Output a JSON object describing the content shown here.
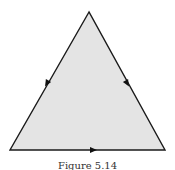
{
  "figure": {
    "shape": "equilateral-triangle",
    "fill_color": "#e4e4e4",
    "stroke_color": "#1a1a1a",
    "vertices": [
      [
        89,
        12
      ],
      [
        10,
        150
      ],
      [
        165,
        150
      ]
    ],
    "edge_arrows": [
      {
        "edge": "left",
        "direction": "down-left",
        "x": 47,
        "y": 83
      },
      {
        "edge": "right",
        "direction": "down-right",
        "x": 127,
        "y": 83
      },
      {
        "edge": "bottom",
        "direction": "right",
        "x": 93,
        "y": 150
      }
    ]
  },
  "caption": "Figure 5.14"
}
